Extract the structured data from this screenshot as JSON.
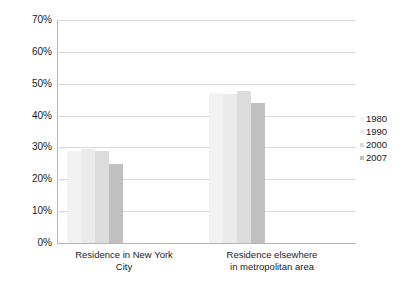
{
  "chart_data": {
    "type": "bar",
    "title": "",
    "subtitle": "",
    "xlabel": "",
    "ylabel": "",
    "categories": [
      "Residence in New York City",
      "Residence elsewhere in metropolitan area"
    ],
    "category_lines": [
      [
        "Residence in New York",
        "City"
      ],
      [
        "Residence elsewhere",
        "in metropolitan area"
      ]
    ],
    "series": [
      {
        "name": "1980",
        "color": "#f2f2f2",
        "values": [
          29.0,
          47.0
        ]
      },
      {
        "name": "1990",
        "color": "#ebebeb",
        "values": [
          29.6,
          46.8
        ]
      },
      {
        "name": "2000",
        "color": "#dcdcdc",
        "values": [
          28.8,
          47.6
        ]
      },
      {
        "name": "2007",
        "color": "#c0c0c0",
        "values": [
          24.8,
          43.8
        ]
      }
    ],
    "ylim": [
      0,
      70
    ],
    "ytick_values": [
      0,
      10,
      20,
      30,
      40,
      50,
      60,
      70
    ],
    "ytick_labels": [
      "0%",
      "10%",
      "20%",
      "30%",
      "40%",
      "50%",
      "60%",
      "70%"
    ],
    "grid": true,
    "legend_position": "right",
    "legend_entries": [
      "1980",
      "1990",
      "2000",
      "2007"
    ],
    "axis_color": "#b4b4b4",
    "grid_color": "#d9d9d9",
    "text_color": "#1a1a1a",
    "background": "#ffffff"
  }
}
